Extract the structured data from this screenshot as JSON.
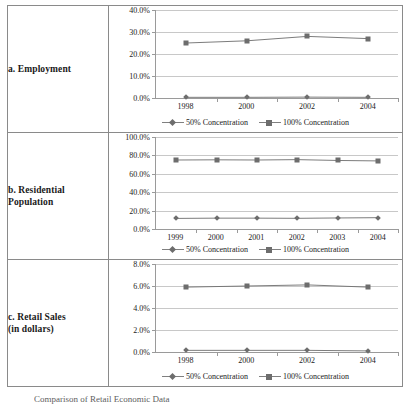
{
  "figure": {
    "caption": "Comparison of Retail Economic Data",
    "legend": [
      {
        "name": "legend-50",
        "label": "50% Concentration",
        "marker": "diamond",
        "color": "#6d6d6d"
      },
      {
        "name": "legend-100",
        "label": "100% Concentration",
        "marker": "square",
        "color": "#6d6d6d"
      }
    ]
  },
  "rows": [
    {
      "id": "employment",
      "label": "a. Employment",
      "chart_data": {
        "type": "line",
        "title": "a. Employment",
        "xlabel": "",
        "ylabel": "",
        "x": [
          "1998",
          "2000",
          "2002",
          "2004"
        ],
        "categories": [
          "1998",
          "2000",
          "2002",
          "2004"
        ],
        "yticks": [
          "0.0%",
          "10.0%",
          "20.0%",
          "30.0%",
          "40.0%"
        ],
        "ytick_values": [
          0,
          10,
          20,
          30,
          40
        ],
        "ylim": [
          0,
          40
        ],
        "grid": true,
        "legend_position": "bottom",
        "series": [
          {
            "name": "50% Concentration",
            "marker": "diamond",
            "color": "#6d6d6d",
            "values": [
              0.3,
              0.3,
              0.4,
              0.3
            ]
          },
          {
            "name": "100% Concentration",
            "marker": "square",
            "color": "#6d6d6d",
            "values": [
              25.0,
              26.0,
              28.0,
              27.0
            ]
          }
        ]
      }
    },
    {
      "id": "residential-population",
      "label": "b. Residential Population",
      "chart_data": {
        "type": "line",
        "title": "b. Residential Population",
        "xlabel": "",
        "ylabel": "",
        "x": [
          "1999",
          "2000",
          "2001",
          "2002",
          "2003",
          "2004"
        ],
        "categories": [
          "1999",
          "2000",
          "2001",
          "2002",
          "2003",
          "2004"
        ],
        "yticks": [
          "0.0%",
          "20.0%",
          "40.0%",
          "60.0%",
          "80.0%",
          "100.0%"
        ],
        "ytick_values": [
          0,
          20,
          40,
          60,
          80,
          100
        ],
        "ylim": [
          0,
          100
        ],
        "grid": true,
        "legend_position": "bottom",
        "series": [
          {
            "name": "50% Concentration",
            "marker": "diamond",
            "color": "#6d6d6d",
            "values": [
              11.5,
              11.8,
              11.8,
              11.6,
              12.0,
              12.3
            ]
          },
          {
            "name": "100% Concentration",
            "marker": "square",
            "color": "#6d6d6d",
            "values": [
              75.0,
              75.2,
              75.0,
              75.4,
              74.5,
              74.0
            ]
          }
        ]
      }
    },
    {
      "id": "retail-sales",
      "label": "c. Retail Sales (in dollars)",
      "label_line1": "c. Retail Sales",
      "label_line2": "(in dollars)",
      "chart_data": {
        "type": "line",
        "title": "c. Retail Sales (in dollars)",
        "xlabel": "",
        "ylabel": "",
        "x": [
          "1998",
          "2000",
          "2002",
          "2004"
        ],
        "categories": [
          "1998",
          "2000",
          "2002",
          "2004"
        ],
        "yticks": [
          "0.0%",
          "2.0%",
          "4.0%",
          "6.0%",
          "8.0%"
        ],
        "ytick_values": [
          0,
          2,
          4,
          6,
          8
        ],
        "ylim": [
          0,
          8
        ],
        "grid": true,
        "legend_position": "bottom",
        "series": [
          {
            "name": "50% Concentration",
            "marker": "diamond",
            "color": "#6d6d6d",
            "values": [
              0.15,
              0.15,
              0.15,
              0.1
            ]
          },
          {
            "name": "100% Concentration",
            "marker": "square",
            "color": "#6d6d6d",
            "values": [
              5.9,
              6.0,
              6.1,
              5.9
            ]
          }
        ]
      }
    }
  ]
}
